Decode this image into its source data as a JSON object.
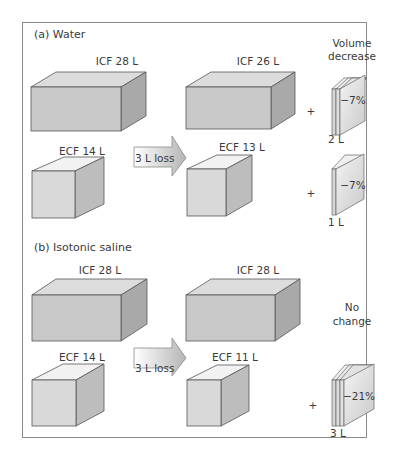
{
  "panel_a": {
    "title": "(a) Water",
    "before": {
      "icf_label": "ICF 28 L",
      "ecf_label": "ECF 14 L"
    },
    "arrow_label": "3 L loss",
    "after": {
      "icf_label": "ICF 26 L",
      "ecf_label": "ECF 13 L"
    },
    "result_header": [
      "Volume",
      "decrease"
    ],
    "icf_change": {
      "plus": "+",
      "percent": "−7%",
      "volume": "2 L"
    },
    "ecf_change": {
      "plus": "+",
      "percent": "−7%",
      "volume": "1 L"
    }
  },
  "panel_b": {
    "title": "(b) Isotonic saline",
    "before": {
      "icf_label": "ICF 28 L",
      "ecf_label": "ECF 14 L"
    },
    "arrow_label": "3 L loss",
    "after": {
      "icf_label": "ICF 28 L",
      "ecf_label": "ECF 11 L"
    },
    "result_header": [
      "No",
      "change"
    ],
    "ecf_change": {
      "plus": "+",
      "percent": "−21%",
      "volume": "3 L"
    }
  },
  "colors": {
    "border": "#8a8a8a",
    "box_front": "#c8c8c8",
    "box_top": "#dcdcdc",
    "box_side": "#a9a9a9",
    "cube_front": "#d9d9d9",
    "cube_top": "#f2f2f2",
    "cube_side": "#bdbdbd",
    "text": "#3a3a3a"
  }
}
